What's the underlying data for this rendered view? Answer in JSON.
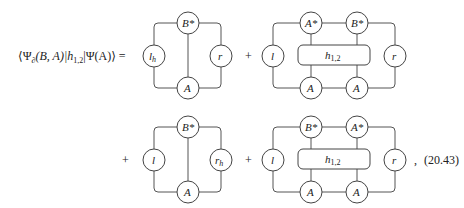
{
  "equation": {
    "lhs": "⟨Ψ∂(B,A)|h1,2|Ψ(A)⟩ =",
    "lhs_parts": {
      "psi_open": "⟨Ψ",
      "sub": "∂",
      "mid": "(B, A)|h",
      "h_sub": "1,2",
      "rest": "|Ψ(A)⟩ ="
    },
    "plus": "+",
    "terminator": ",",
    "eq_number": "(20.43)"
  },
  "diagrams": [
    {
      "id": 1,
      "left": "l",
      "left_sub": "h",
      "right": "r",
      "right_sub": "",
      "top": [
        "B*"
      ],
      "bottom": [
        "A"
      ],
      "operator": null
    },
    {
      "id": 2,
      "left": "l",
      "left_sub": "",
      "right": "r",
      "right_sub": "",
      "top": [
        "A*",
        "B*"
      ],
      "bottom": [
        "A",
        "A"
      ],
      "operator": "h1,2"
    },
    {
      "id": 3,
      "left": "l",
      "left_sub": "",
      "right": "r",
      "right_sub": "h",
      "top": [
        "B*"
      ],
      "bottom": [
        "A"
      ],
      "operator": null
    },
    {
      "id": 4,
      "left": "l",
      "left_sub": "",
      "right": "r",
      "right_sub": "",
      "top": [
        "B*",
        "A*"
      ],
      "bottom": [
        "A",
        "A"
      ],
      "operator": "h1,2"
    }
  ],
  "labels": {
    "h": "h",
    "h_sub": "1,2",
    "star": "*"
  }
}
